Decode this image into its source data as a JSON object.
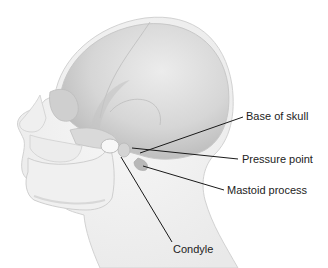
{
  "diagram": {
    "labels": [
      {
        "id": "base-of-skull",
        "text": "Base of skull"
      },
      {
        "id": "pressure-point",
        "text": "Pressure point"
      },
      {
        "id": "mastoid-process",
        "text": "Mastoid process"
      },
      {
        "id": "condyle",
        "text": "Condyle"
      }
    ],
    "colors": {
      "background": "#ffffff",
      "skin": "#f3f3f3",
      "skull": "#dcdcdc",
      "skull_shadow": "#bdbdbd",
      "line": "#1a1a1a",
      "text": "#222222"
    }
  }
}
